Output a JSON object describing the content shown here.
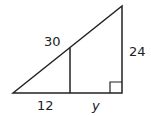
{
  "diagram": {
    "type": "similar-right-triangles",
    "labels": {
      "hypotenuse_segment": "30",
      "vertical_side": "24",
      "base_left_segment": "12",
      "base_right_segment": "y"
    },
    "colors": {
      "stroke": "#222222",
      "background": "#ffffff"
    }
  }
}
